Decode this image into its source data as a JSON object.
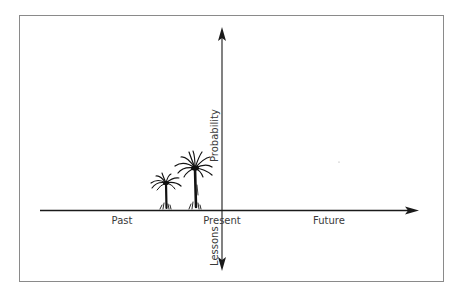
{
  "diagram": {
    "type": "timeline-axes",
    "horizontal_axis": {
      "labels": {
        "past": "Past",
        "present": "Present",
        "future": "Future"
      },
      "direction": "left-to-right"
    },
    "vertical_axis": {
      "labels": {
        "up": "Probability",
        "down": "Lessons"
      },
      "direction": "bidirectional"
    },
    "illustrations": [
      {
        "name": "palm-tree-small",
        "position": "past, near present"
      },
      {
        "name": "palm-tree-large",
        "position": "past, adjacent to present"
      }
    ],
    "colors": {
      "axis": "#1a1a1a",
      "frame": "#8a8a8a",
      "text": "#3a3a3a",
      "background": "#ffffff"
    }
  }
}
